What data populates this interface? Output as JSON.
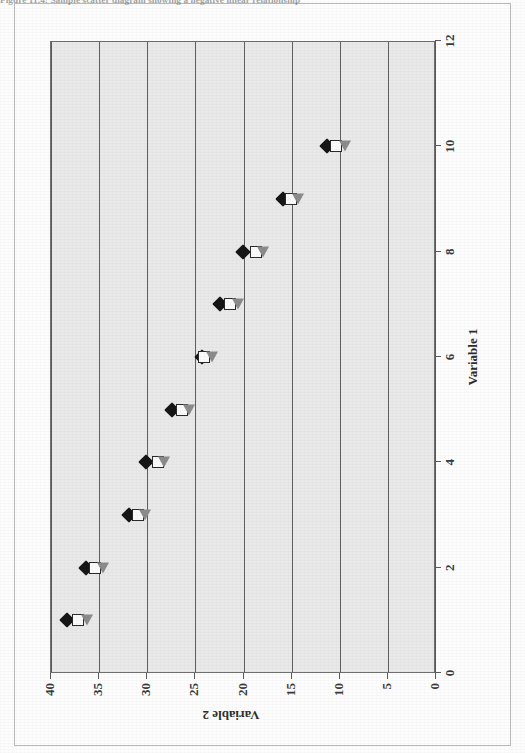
{
  "figure": {
    "caption": "Figure 11.4:   Sample scatter diagram showing a negative linear relationship"
  },
  "chart_data": {
    "type": "scatter",
    "title": "Sample scatter diagram showing a negative linear relationship",
    "xlabel": "Variable 1",
    "ylabel": "Variable 2",
    "xlim": [
      0,
      12
    ],
    "ylim": [
      0,
      40
    ],
    "xticks": [
      0,
      2,
      4,
      6,
      8,
      10,
      12
    ],
    "yticks": [
      0,
      5,
      10,
      15,
      20,
      25,
      30,
      35,
      40
    ],
    "grid": true,
    "grid_axis": "y",
    "legend": "none",
    "plot_background": "#e9e9e9",
    "series": [
      {
        "name": "series-diamond",
        "marker": "filled-diamond",
        "color": "#151515",
        "x": [
          1,
          2,
          3,
          4,
          5,
          6,
          7,
          8,
          9,
          10
        ],
        "y": [
          38.2,
          36.3,
          31.8,
          30.0,
          27.3,
          24.2,
          22.3,
          19.9,
          15.8,
          11.2
        ]
      },
      {
        "name": "series-square",
        "marker": "open-square",
        "color": "#2a2a2a",
        "x": [
          1,
          2,
          3,
          4,
          5,
          6,
          7,
          8,
          9,
          10
        ],
        "y": [
          37.1,
          35.3,
          30.9,
          28.8,
          26.3,
          24.0,
          21.3,
          18.6,
          15.0,
          10.3
        ]
      },
      {
        "name": "series-triangle",
        "marker": "gray-triangle",
        "color": "#8b8b8b",
        "x": [
          1,
          2,
          3,
          4,
          5,
          6,
          7,
          8,
          9,
          10
        ],
        "y": [
          36.2,
          34.5,
          30.1,
          28.2,
          25.6,
          23.2,
          20.5,
          17.9,
          14.2,
          9.3
        ]
      }
    ]
  }
}
